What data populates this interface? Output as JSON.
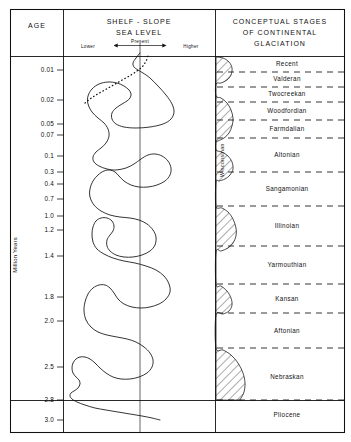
{
  "columns": {
    "age_header": "AGE",
    "sealevel_header_line1": "SHELF - SLOPE",
    "sealevel_header_line2": "SEA LEVEL",
    "sealevel_sub_lower": "Lower",
    "sealevel_sub_present": "Present",
    "sealevel_sub_higher": "Higher",
    "glaciation_header_line1": "CONCEPTUAL  STAGES",
    "glaciation_header_line2": "OF  CONTINENTAL",
    "glaciation_header_line3": "GLACIATION"
  },
  "axis": {
    "title": "Million Years",
    "epoch_boundary_label": "2.8"
  },
  "wisconsinan_label": "Wisconsinan",
  "chart_data": {
    "type": "line",
    "xlabel": "Shelf - slope sea level",
    "ylabel": "Million Years",
    "ylim": [
      0.0,
      3.0
    ],
    "yscale": "log-like stratigraphic",
    "grid": false,
    "legend": null,
    "y_ticks": [
      {
        "label": "0.01",
        "value": 0.01,
        "py": 70
      },
      {
        "label": "0.02",
        "value": 0.02,
        "py": 100
      },
      {
        "label": "0.05",
        "value": 0.05,
        "py": 124
      },
      {
        "label": "0.07",
        "value": 0.07,
        "py": 135
      },
      {
        "label": "0.1",
        "value": 0.1,
        "py": 156
      },
      {
        "label": "0.3",
        "value": 0.3,
        "py": 172
      },
      {
        "label": "0.4",
        "value": 0.4,
        "py": 184
      },
      {
        "label": "0.7",
        "value": 0.7,
        "py": 199
      },
      {
        "label": "1.0",
        "value": 1.0,
        "py": 216
      },
      {
        "label": "1.2",
        "value": 1.2,
        "py": 230
      },
      {
        "label": "1.4",
        "value": 1.4,
        "py": 256
      },
      {
        "label": "1.8",
        "value": 1.8,
        "py": 297
      },
      {
        "label": "2.0",
        "value": 2.0,
        "py": 321
      },
      {
        "label": "2.5",
        "value": 2.5,
        "py": 367
      },
      {
        "label": "2.8",
        "value": 2.8,
        "py": 400
      },
      {
        "label": "3.0",
        "value": 3.0,
        "py": 420
      }
    ],
    "sea_level_axis": {
      "present_position_px": 140,
      "lower_direction": "left",
      "higher_direction": "right"
    },
    "sea_level_curve_px": [
      [
        140,
        53
      ],
      [
        136,
        58
      ],
      [
        133,
        63
      ],
      [
        134,
        67
      ],
      [
        138,
        70
      ],
      [
        143,
        73
      ],
      [
        150,
        78
      ],
      [
        158,
        86
      ],
      [
        166,
        95
      ],
      [
        172,
        104
      ],
      [
        174,
        112
      ],
      [
        171,
        119
      ],
      [
        163,
        124
      ],
      [
        150,
        127
      ],
      [
        136,
        128
      ],
      [
        124,
        127
      ],
      [
        116,
        124
      ],
      [
        112,
        119
      ],
      [
        112,
        113
      ],
      [
        116,
        108
      ],
      [
        122,
        104
      ],
      [
        127,
        101
      ],
      [
        130,
        98
      ],
      [
        131,
        94
      ],
      [
        129,
        90
      ],
      [
        124,
        86
      ],
      [
        117,
        83
      ],
      [
        108,
        82
      ],
      [
        99,
        84
      ],
      [
        92,
        89
      ],
      [
        88,
        96
      ],
      [
        88,
        104
      ],
      [
        92,
        112
      ],
      [
        98,
        118
      ],
      [
        104,
        123
      ],
      [
        108,
        129
      ],
      [
        109,
        136
      ],
      [
        106,
        143
      ],
      [
        101,
        148
      ],
      [
        96,
        152
      ],
      [
        93,
        157
      ],
      [
        94,
        162
      ],
      [
        99,
        166
      ],
      [
        107,
        169
      ],
      [
        116,
        170
      ],
      [
        126,
        168
      ],
      [
        134,
        164
      ],
      [
        141,
        159
      ],
      [
        148,
        155
      ],
      [
        155,
        154
      ],
      [
        162,
        156
      ],
      [
        168,
        161
      ],
      [
        171,
        168
      ],
      [
        170,
        175
      ],
      [
        165,
        181
      ],
      [
        157,
        185
      ],
      [
        148,
        187
      ],
      [
        139,
        187
      ],
      [
        131,
        185
      ],
      [
        124,
        181
      ],
      [
        119,
        176
      ],
      [
        115,
        172
      ],
      [
        110,
        170
      ],
      [
        104,
        171
      ],
      [
        98,
        175
      ],
      [
        93,
        181
      ],
      [
        90,
        189
      ],
      [
        90,
        197
      ],
      [
        94,
        205
      ],
      [
        101,
        211
      ],
      [
        110,
        215
      ],
      [
        120,
        217
      ],
      [
        130,
        218
      ],
      [
        139,
        220
      ],
      [
        147,
        224
      ],
      [
        153,
        230
      ],
      [
        156,
        237
      ],
      [
        155,
        245
      ],
      [
        150,
        251
      ],
      [
        142,
        255
      ],
      [
        133,
        257
      ],
      [
        124,
        257
      ],
      [
        116,
        255
      ],
      [
        110,
        251
      ],
      [
        107,
        246
      ],
      [
        107,
        240
      ],
      [
        110,
        235
      ],
      [
        113,
        231
      ],
      [
        114,
        226
      ],
      [
        112,
        221
      ],
      [
        107,
        218
      ],
      [
        101,
        218
      ],
      [
        96,
        221
      ],
      [
        93,
        227
      ],
      [
        92,
        234
      ],
      [
        93,
        242
      ],
      [
        97,
        249
      ],
      [
        104,
        254
      ],
      [
        113,
        258
      ],
      [
        124,
        261
      ],
      [
        135,
        263
      ],
      [
        146,
        266
      ],
      [
        156,
        270
      ],
      [
        164,
        276
      ],
      [
        169,
        284
      ],
      [
        170,
        292
      ],
      [
        166,
        299
      ],
      [
        159,
        304
      ],
      [
        150,
        307
      ],
      [
        141,
        308
      ],
      [
        132,
        307
      ],
      [
        124,
        304
      ],
      [
        118,
        299
      ],
      [
        114,
        293
      ],
      [
        110,
        288
      ],
      [
        105,
        285
      ],
      [
        99,
        285
      ],
      [
        93,
        288
      ],
      [
        88,
        294
      ],
      [
        85,
        302
      ],
      [
        84,
        311
      ],
      [
        86,
        320
      ],
      [
        91,
        327
      ],
      [
        98,
        332
      ],
      [
        107,
        335
      ],
      [
        117,
        337
      ],
      [
        127,
        339
      ],
      [
        136,
        342
      ],
      [
        144,
        347
      ],
      [
        150,
        353
      ],
      [
        153,
        360
      ],
      [
        152,
        367
      ],
      [
        147,
        373
      ],
      [
        139,
        377
      ],
      [
        130,
        379
      ],
      [
        121,
        379
      ],
      [
        113,
        377
      ],
      [
        106,
        373
      ],
      [
        100,
        368
      ],
      [
        95,
        363
      ],
      [
        90,
        359
      ],
      [
        85,
        357
      ],
      [
        80,
        357
      ],
      [
        76,
        359
      ],
      [
        73,
        363
      ],
      [
        72,
        368
      ],
      [
        73,
        373
      ],
      [
        76,
        377
      ],
      [
        79,
        380
      ],
      [
        80,
        384
      ],
      [
        78,
        388
      ],
      [
        74,
        391
      ],
      [
        71,
        393
      ],
      [
        70,
        396
      ],
      [
        72,
        399
      ],
      [
        77,
        402
      ],
      [
        85,
        405
      ],
      [
        95,
        408
      ],
      [
        106,
        410
      ],
      [
        118,
        412
      ],
      [
        130,
        414
      ],
      [
        142,
        416
      ],
      [
        152,
        418
      ],
      [
        160,
        420
      ]
    ],
    "sea_level_dashed_segment_px": [
      [
        85,
        103
      ],
      [
        90,
        99
      ],
      [
        96,
        95
      ],
      [
        103,
        91
      ],
      [
        110,
        87
      ],
      [
        117,
        83
      ],
      [
        124,
        79
      ],
      [
        131,
        75
      ],
      [
        137,
        71
      ],
      [
        142,
        67
      ],
      [
        145,
        63
      ],
      [
        147,
        59
      ],
      [
        148,
        56
      ]
    ],
    "glaciation_stages": [
      {
        "name": "Recent",
        "label_py": 64,
        "top_py": 57,
        "bottom_py": 72
      },
      {
        "name": "Valderan",
        "label_py": 79,
        "top_py": 72,
        "bottom_py": 87
      },
      {
        "name": "Twocreekan",
        "label_py": 94,
        "top_py": 87,
        "bottom_py": 102
      },
      {
        "name": "Woodfordian",
        "label_py": 111,
        "top_py": 102,
        "bottom_py": 120
      },
      {
        "name": "Farmdalian",
        "label_py": 129,
        "top_py": 120,
        "bottom_py": 138
      },
      {
        "name": "Altonian",
        "label_py": 155,
        "top_py": 138,
        "bottom_py": 172
      },
      {
        "name": "Sangamonian",
        "label_py": 189,
        "top_py": 172,
        "bottom_py": 206
      },
      {
        "name": "Illinoian",
        "label_py": 226,
        "top_py": 206,
        "bottom_py": 246
      },
      {
        "name": "Yarmouthian",
        "label_py": 265,
        "top_py": 246,
        "bottom_py": 284
      },
      {
        "name": "Kansan",
        "label_py": 299,
        "top_py": 284,
        "bottom_py": 313
      },
      {
        "name": "Aftonian",
        "label_py": 331,
        "top_py": 313,
        "bottom_py": 348
      },
      {
        "name": "Nebraskan",
        "label_py": 377,
        "top_py": 348,
        "bottom_py": 400
      },
      {
        "name": "Pliocene",
        "label_py": 415,
        "top_py": 400,
        "bottom_py": 432
      }
    ],
    "glaciation_intensity_px": [
      [
        216,
        57
      ],
      [
        223,
        58
      ],
      [
        229,
        62
      ],
      [
        232,
        68
      ],
      [
        231,
        75
      ],
      [
        227,
        80
      ],
      [
        221,
        83
      ],
      [
        216,
        84
      ],
      [
        216,
        96
      ],
      [
        221,
        98
      ],
      [
        227,
        103
      ],
      [
        231,
        110
      ],
      [
        233,
        118
      ],
      [
        232,
        126
      ],
      [
        229,
        133
      ],
      [
        224,
        138
      ],
      [
        218,
        141
      ],
      [
        216,
        142
      ],
      [
        216,
        150
      ],
      [
        222,
        152
      ],
      [
        228,
        156
      ],
      [
        232,
        162
      ],
      [
        233,
        169
      ],
      [
        230,
        175
      ],
      [
        225,
        179
      ],
      [
        219,
        181
      ],
      [
        216,
        182
      ],
      [
        216,
        206
      ],
      [
        222,
        208
      ],
      [
        228,
        212
      ],
      [
        233,
        219
      ],
      [
        236,
        228
      ],
      [
        236,
        236
      ],
      [
        233,
        243
      ],
      [
        228,
        248
      ],
      [
        221,
        251
      ],
      [
        216,
        252
      ],
      [
        216,
        284
      ],
      [
        221,
        286
      ],
      [
        227,
        291
      ],
      [
        231,
        298
      ],
      [
        232,
        305
      ],
      [
        229,
        311
      ],
      [
        223,
        314
      ],
      [
        216,
        315
      ],
      [
        216,
        348
      ],
      [
        223,
        350
      ],
      [
        231,
        355
      ],
      [
        238,
        363
      ],
      [
        243,
        373
      ],
      [
        245,
        383
      ],
      [
        244,
        392
      ],
      [
        241,
        398
      ],
      [
        238,
        400
      ],
      [
        216,
        400
      ]
    ],
    "colors": {
      "ink": "#111111",
      "background": "#ffffff"
    }
  }
}
